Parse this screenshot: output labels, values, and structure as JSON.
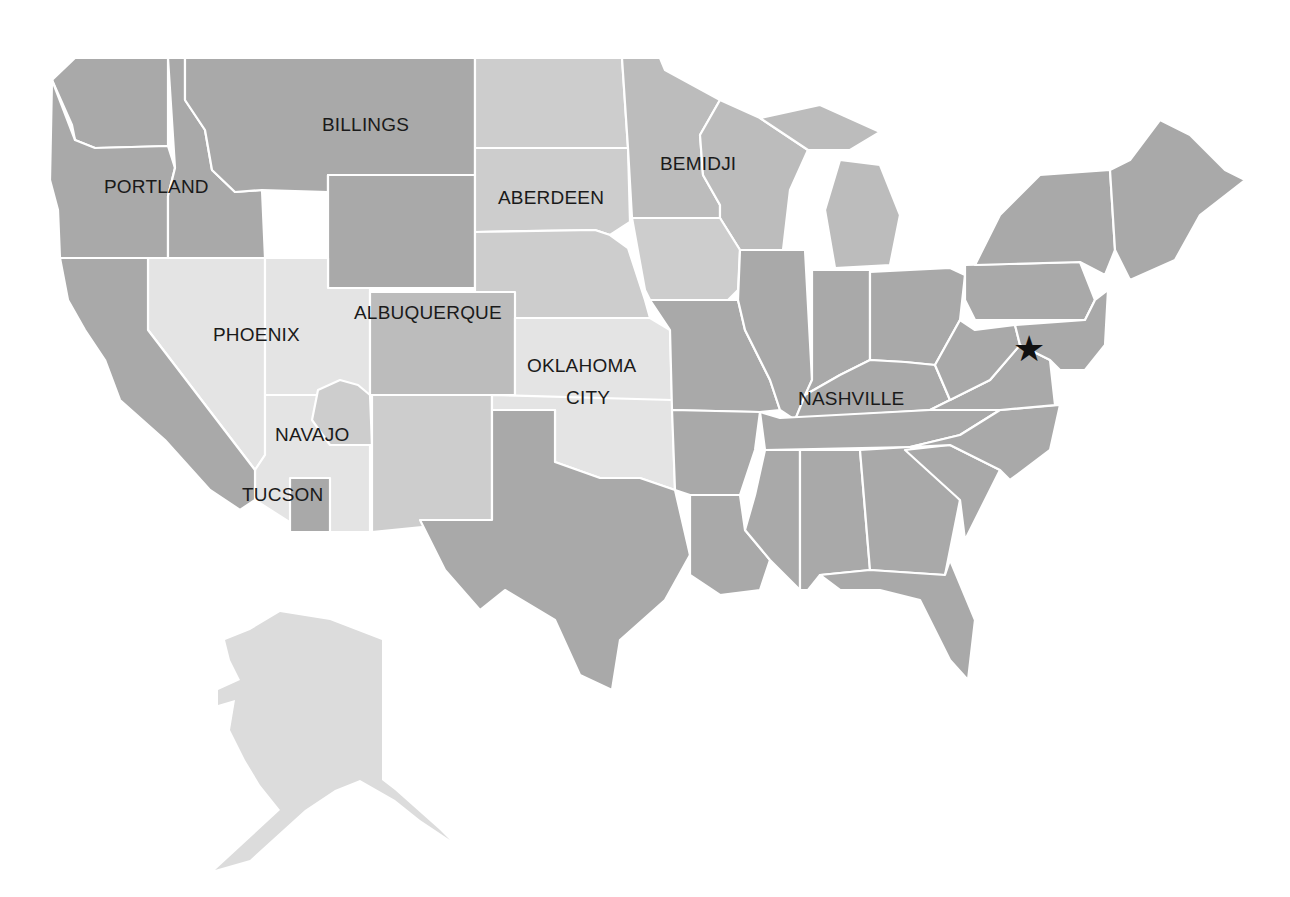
{
  "map": {
    "title": "",
    "colors": {
      "dark": "#a9a9a9",
      "mid": "#bcbcbc",
      "light": "#cdcdcd",
      "lightest": "#e4e4e4",
      "alaska": "#dcdcdc",
      "border": "#ffffff",
      "label": "#1a1a1a"
    },
    "areas": [
      {
        "name": "PORTLAND",
        "lines": [
          "PORTLAND"
        ],
        "shade": "dark"
      },
      {
        "name": "BILLINGS",
        "lines": [
          "BILLINGS"
        ],
        "shade": "dark"
      },
      {
        "name": "ABERDEEN",
        "lines": [
          "ABERDEEN"
        ],
        "shade": "light"
      },
      {
        "name": "BEMIDJI",
        "lines": [
          "BEMIDJI"
        ],
        "shade": "mid"
      },
      {
        "name": "PHOENIX",
        "lines": [
          "PHOENIX"
        ],
        "shade": "lightest"
      },
      {
        "name": "ALBUQUERQUE",
        "lines": [
          "ALBUQUERQUE"
        ],
        "shade": "light"
      },
      {
        "name": "OKLAHOMA CITY",
        "lines": [
          "OKLAHOMA",
          "CITY"
        ],
        "shade": "lightest"
      },
      {
        "name": "NAVAJO",
        "lines": [
          "NAVAJO"
        ],
        "shade": "lightest"
      },
      {
        "name": "TUCSON",
        "lines": [
          "TUCSON"
        ],
        "shade": "lightest"
      },
      {
        "name": "NASHVILLE",
        "lines": [
          "NASHVILLE"
        ],
        "shade": "dark"
      }
    ],
    "marker": {
      "icon": "star-icon",
      "glyph": "★",
      "location": "Washington, DC area"
    }
  }
}
